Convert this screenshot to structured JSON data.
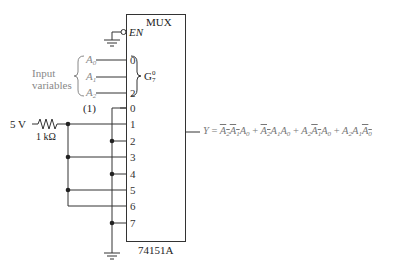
{
  "chip": {
    "title": "MUX",
    "part_number": "74151A",
    "enable_label": "EN",
    "group_label": "G",
    "group_sup": "0",
    "group_sub": "7"
  },
  "select_inputs": {
    "group_label_line1": "Input",
    "group_label_line2": "variables",
    "pins": [
      {
        "pin": "0",
        "signal": "A",
        "index": "0"
      },
      {
        "pin": "1",
        "signal": "A",
        "index": "1"
      },
      {
        "pin": "2",
        "signal": "A",
        "index": "2"
      }
    ]
  },
  "data_inputs": {
    "pins": [
      "0",
      "1",
      "2",
      "3",
      "4",
      "5",
      "6",
      "7"
    ],
    "connected_high": [
      "1",
      "3",
      "5",
      "6"
    ],
    "connected_low": [
      "0",
      "2",
      "4",
      "7"
    ]
  },
  "annotation": "(1)",
  "source": {
    "voltage": "5 V",
    "resistor": "1 kΩ"
  },
  "output": {
    "label": "Y",
    "equals": "=",
    "terms": [
      [
        {
          "v": "A",
          "i": "2",
          "bar": true
        },
        {
          "v": "A",
          "i": "1",
          "bar": true
        },
        {
          "v": "A",
          "i": "0",
          "bar": false
        }
      ],
      [
        {
          "v": "A",
          "i": "2",
          "bar": true
        },
        {
          "v": "A",
          "i": "1",
          "bar": false
        },
        {
          "v": "A",
          "i": "0",
          "bar": false
        }
      ],
      [
        {
          "v": "A",
          "i": "2",
          "bar": false
        },
        {
          "v": "A",
          "i": "1",
          "bar": true
        },
        {
          "v": "A",
          "i": "0",
          "bar": false
        }
      ],
      [
        {
          "v": "A",
          "i": "2",
          "bar": false
        },
        {
          "v": "A",
          "i": "1",
          "bar": false
        },
        {
          "v": "A",
          "i": "0",
          "bar": true
        }
      ]
    ],
    "plus": "+"
  }
}
